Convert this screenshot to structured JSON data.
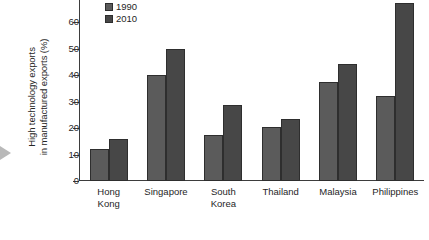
{
  "chart_data": {
    "type": "bar",
    "title": "",
    "xlabel": "",
    "ylabel": "High technology exports\nin manufactured exports (%)",
    "ylim": [
      0,
      70
    ],
    "yticks": [
      0,
      10,
      20,
      30,
      40,
      50,
      60
    ],
    "ytick_labels": [
      "0",
      "10",
      "20",
      "30",
      "40",
      "50",
      "60"
    ],
    "grid": false,
    "legend_position": "top-left",
    "categories": [
      "Hong\nKong",
      "Singapore",
      "South\nKorea",
      "Thailand",
      "Malaysia",
      "Philippines"
    ],
    "series": [
      {
        "name": "1990",
        "color": "#5b5b5b",
        "values": [
          12,
          40,
          17.5,
          20.5,
          37.5,
          32
        ]
      },
      {
        "name": "2010",
        "color": "#474747",
        "values": [
          16,
          50,
          28.5,
          23.5,
          44,
          67
        ]
      }
    ]
  },
  "legend": {
    "items": [
      {
        "label": "1990"
      },
      {
        "label": "2010"
      }
    ]
  },
  "colors": {
    "series_1990": "#5b5b5b",
    "series_2010": "#474747",
    "axis": "#3d3d3d",
    "text": "#262626",
    "background": "#ffffff",
    "edge_pointer": "#b9b9b9"
  }
}
